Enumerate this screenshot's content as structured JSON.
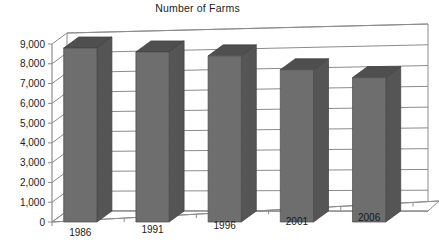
{
  "chart_data": {
    "type": "bar",
    "title": "Number of Farms",
    "xlabel": "",
    "ylabel": "",
    "categories": [
      "1986",
      "1991",
      "1996",
      "2001",
      "2006"
    ],
    "values": [
      8800,
      8600,
      8400,
      7700,
      7300
    ],
    "series": [
      {
        "name": "Number of Farms",
        "values": [
          8800,
          8600,
          8400,
          7700,
          7300
        ]
      }
    ],
    "ylim": [
      0,
      9000
    ],
    "ytick_values": [
      0,
      1000,
      2000,
      3000,
      4000,
      5000,
      6000,
      7000,
      8000,
      9000
    ],
    "ytick_labels": [
      "0",
      "1,000",
      "2,000",
      "3,000",
      "4,000",
      "5,000",
      "6,000",
      "7,000",
      "8,000",
      "9,000"
    ],
    "grid": true,
    "legend": false,
    "legend_position": "none",
    "style": "3d-column",
    "colors": {
      "bar_front": "#6e6e6e",
      "bar_side": "#555555",
      "bar_top": "#4f4f4f",
      "gridline": "#8c8c8c",
      "background": "#ffffff",
      "text": "#1a1a1a"
    }
  },
  "axis": {
    "y_labels": [
      "9,000",
      "8,000",
      "7,000",
      "6,000",
      "5,000",
      "4,000",
      "3,000",
      "2,000",
      "1,000",
      "0"
    ],
    "x_labels": [
      "1986",
      "1991",
      "1996",
      "2001",
      "2006"
    ]
  }
}
